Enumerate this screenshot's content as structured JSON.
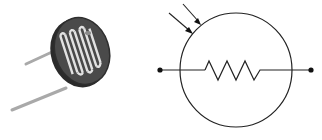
{
  "figure": {
    "left_panel": {
      "label": "Photoresistor photo",
      "component": "light-dependent-resistor",
      "colors": {
        "body": "#3a3a3a",
        "track": "#d8d8d8",
        "leads": "#b8b8b8"
      }
    },
    "right_panel": {
      "label": "Photoresistor schematic symbol",
      "elements": [
        "incoming-light-arrows",
        "enclosing-circle",
        "zigzag-resistor",
        "terminal-dots"
      ],
      "colors": {
        "stroke": "#222222",
        "background": "#ffffff"
      }
    }
  }
}
